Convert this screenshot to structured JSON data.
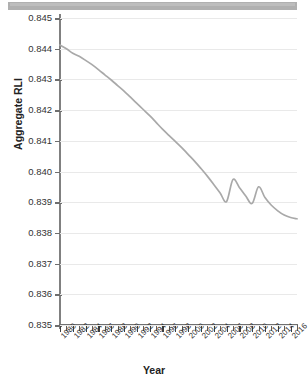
{
  "window": {
    "chrome_bar": "scrollbar-track"
  },
  "chart_data": {
    "type": "line",
    "title": "",
    "xlabel": "Year",
    "ylabel": "Aggregate RLI",
    "xlim": [
      1980,
      2017
    ],
    "ylim": [
      0.835,
      0.845
    ],
    "grid": true,
    "legend": "none",
    "line_color": "#a9a9a9",
    "background": "#ffffff",
    "gridline_color": "#e9e9e9",
    "ytick_labels": [
      "0.845",
      "0.844",
      "0.843",
      "0.842",
      "0.841",
      "0.840",
      "0.839",
      "0.838",
      "0.837",
      "0.836",
      "0.835"
    ],
    "ytick_values": [
      0.845,
      0.844,
      0.843,
      0.842,
      0.841,
      0.84,
      0.839,
      0.838,
      0.837,
      0.836,
      0.835
    ],
    "xtick_labels": [
      "1980",
      "1982",
      "1984",
      "1986",
      "1988",
      "1990",
      "1992",
      "1994",
      "1996",
      "1998",
      "2000",
      "2002",
      "2004",
      "2006",
      "2008",
      "2010",
      "2012",
      "2014",
      "2016"
    ],
    "xtick_values": [
      1980,
      1982,
      1984,
      1986,
      1988,
      1990,
      1992,
      1994,
      1996,
      1998,
      2000,
      2002,
      2004,
      2006,
      2008,
      2010,
      2012,
      2014,
      2016
    ],
    "minor_xticks_every": 1,
    "series": [
      {
        "name": "Aggregate RLI",
        "x": [
          1980,
          1981,
          1982,
          1983,
          1984,
          1985,
          1986,
          1987,
          1988,
          1989,
          1990,
          1991,
          1992,
          1993,
          1994,
          1995,
          1996,
          1997,
          1998,
          1999,
          2000,
          2001,
          2002,
          2003,
          2004,
          2005,
          2006,
          2007,
          2008,
          2009,
          2010,
          2011,
          2012,
          2013,
          2014,
          2015,
          2016,
          2017
        ],
        "values": [
          0.84412,
          0.844,
          0.84385,
          0.84375,
          0.84362,
          0.84348,
          0.84332,
          0.84315,
          0.84298,
          0.8428,
          0.84262,
          0.84242,
          0.84222,
          0.84202,
          0.84182,
          0.8416,
          0.84138,
          0.84118,
          0.84098,
          0.84078,
          0.84056,
          0.84034,
          0.8401,
          0.83985,
          0.83958,
          0.8393,
          0.83902,
          0.83974,
          0.83948,
          0.8392,
          0.83896,
          0.8395,
          0.83915,
          0.8389,
          0.83872,
          0.83858,
          0.8385,
          0.83846
        ]
      }
    ]
  }
}
